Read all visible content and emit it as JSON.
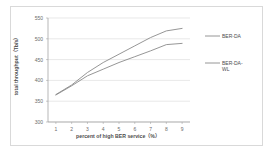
{
  "chart_data": {
    "type": "line",
    "title": "",
    "xlabel": "percent of high BER service（%）",
    "ylabel": "total throughput（Tb/s）",
    "xlim": [
      0.5,
      9.5
    ],
    "ylim": [
      300,
      550
    ],
    "xticks": [
      "1",
      "2",
      "3",
      "4",
      "5",
      "6",
      "7",
      "8",
      "9"
    ],
    "yticks": [
      "300",
      "350",
      "400",
      "450",
      "500",
      "550"
    ],
    "grid": true,
    "legend_position": "right",
    "x": [
      1,
      2,
      3,
      4,
      5,
      6,
      7,
      8,
      9
    ],
    "series": [
      {
        "name": "BER-DA",
        "color": "#8a8a8a",
        "values": [
          366,
          389,
          419,
          443,
          463,
          483,
          503,
          519,
          525
        ]
      },
      {
        "name": "BER-DA-WL",
        "color": "#8a8a8a",
        "values": [
          365,
          387,
          411,
          427,
          443,
          457,
          471,
          486,
          489
        ]
      }
    ]
  },
  "legend": {
    "items": [
      {
        "label": "BER-DA"
      },
      {
        "label": "BER-DA-\nWL"
      }
    ]
  }
}
